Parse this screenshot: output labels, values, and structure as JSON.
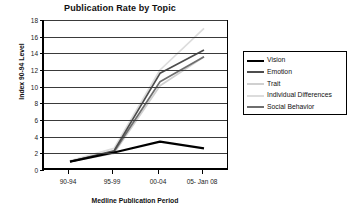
{
  "chart_data": {
    "type": "line",
    "title": "Publication Rate by Topic",
    "xlabel": "Medline Publication  Period",
    "ylabel": "Index 90-94  Level",
    "categories": [
      "90-94",
      "95-99",
      "00-04",
      "05- Jan 08"
    ],
    "ylim": [
      0,
      18
    ],
    "ytick_step": 2,
    "yticks": [
      "0",
      "2",
      "4",
      "6",
      "8",
      "10",
      "12",
      "14",
      "16",
      "18"
    ],
    "grid": true,
    "legend_position": "right",
    "series": [
      {
        "name": "Vision",
        "color": "#000000",
        "values": [
          1.0,
          2.1,
          3.4,
          2.6
        ]
      },
      {
        "name": "Emotion",
        "color": "#4d4d4d",
        "values": [
          1.0,
          2.3,
          11.6,
          14.4
        ]
      },
      {
        "name": "Trait",
        "color": "#d0d0d0",
        "values": [
          1.0,
          2.0,
          10.1,
          13.6
        ]
      },
      {
        "name": "Individual Differences",
        "color": "#dcdcdc",
        "values": [
          1.1,
          2.6,
          12.0,
          17.0
        ]
      },
      {
        "name": "Social Behavior",
        "color": "#6e6e6e",
        "values": [
          1.0,
          2.2,
          10.6,
          13.6
        ]
      }
    ]
  },
  "legend": {
    "items": [
      {
        "label": "Vision"
      },
      {
        "label": "Emotion"
      },
      {
        "label": "Trait"
      },
      {
        "label": "Individual Differences"
      },
      {
        "label": "Social Behavior"
      }
    ]
  }
}
